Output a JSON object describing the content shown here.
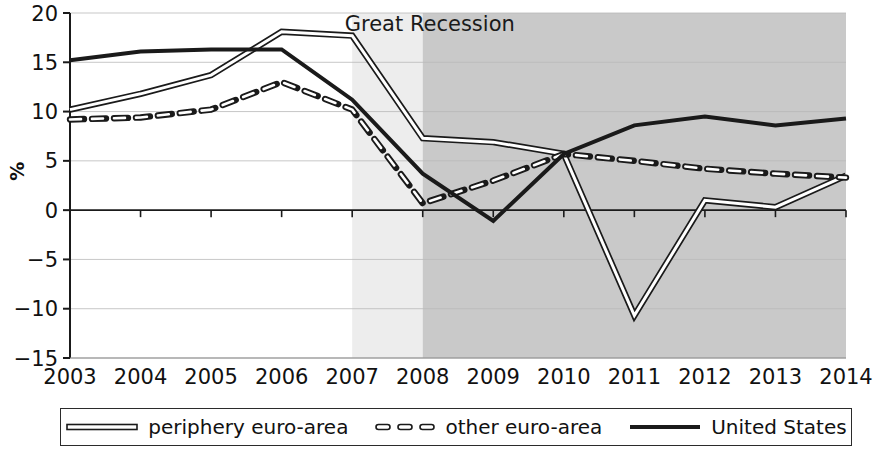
{
  "chart_data": {
    "type": "line",
    "title": "",
    "xlabel": "",
    "ylabel": "%",
    "x": [
      2003,
      2004,
      2005,
      2006,
      2007,
      2008,
      2009,
      2010,
      2011,
      2012,
      2013,
      2014
    ],
    "xtick_labels": [
      "2003",
      "2004",
      "2005",
      "2006",
      "2007",
      "2008",
      "2009",
      "2010",
      "2011",
      "2012",
      "2013",
      "2014"
    ],
    "ytick_labels": [
      "20",
      "15",
      "10",
      "5",
      "0",
      "−5",
      "−10",
      "−15"
    ],
    "yticks": [
      20,
      15,
      10,
      5,
      0,
      -5,
      -10,
      -15
    ],
    "ylim": [
      -15,
      20
    ],
    "xlim": [
      2003,
      2014
    ],
    "grid": true,
    "legend_position": "below-plot",
    "series": [
      {
        "name": "periphery euro-area",
        "style": "double-line",
        "color": "#1a1a1a",
        "values": [
          10.2,
          11.8,
          13.7,
          18.1,
          17.7,
          7.3,
          6.9,
          5.7,
          -10.7,
          1.0,
          0.3,
          3.5
        ]
      },
      {
        "name": "other euro-area",
        "style": "dashed",
        "color": "#1a1a1a",
        "values": [
          9.2,
          9.4,
          10.2,
          13.0,
          10.2,
          0.7,
          3.0,
          5.7,
          5.0,
          4.2,
          3.7,
          3.3
        ]
      },
      {
        "name": "United States",
        "style": "solid",
        "color": "#1a1a1a",
        "values": [
          15.2,
          16.1,
          16.3,
          16.3,
          11.2,
          3.7,
          -1.1,
          5.7,
          8.6,
          9.5,
          8.6,
          9.3
        ]
      }
    ],
    "annotations": [
      {
        "text": "Great Recession",
        "x": 2008.1,
        "y": 18.2
      }
    ],
    "shaded_regions": [
      {
        "name": "pre-recession-shade",
        "from": 2007,
        "to": 2008,
        "color": "#ededed"
      },
      {
        "name": "great-recession-shade",
        "from": 2008,
        "to": 2014,
        "color": "#c9c9c9"
      }
    ]
  },
  "legend": {
    "items": [
      {
        "label": "periphery euro-area",
        "style": "double-line"
      },
      {
        "label": "other euro-area",
        "style": "dashed"
      },
      {
        "label": "United States",
        "style": "solid"
      }
    ]
  },
  "axis": {
    "y_axis_title": "%"
  }
}
